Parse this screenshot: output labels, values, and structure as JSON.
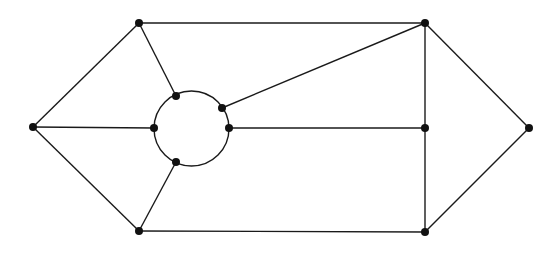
{
  "diagram": {
    "type": "graph",
    "colors": {
      "stroke": "#1a1a1a",
      "node": "#111111",
      "background": "#ffffff"
    },
    "circle": {
      "cx": 191.5,
      "cy": 128.5,
      "r": 37.5
    },
    "nodes": [
      {
        "id": "L",
        "x": 33,
        "y": 127
      },
      {
        "id": "TL",
        "x": 139,
        "y": 23
      },
      {
        "id": "BL",
        "x": 139,
        "y": 231
      },
      {
        "id": "TR",
        "x": 425,
        "y": 23
      },
      {
        "id": "MR",
        "x": 425,
        "y": 128
      },
      {
        "id": "BR",
        "x": 425,
        "y": 232
      },
      {
        "id": "R",
        "x": 529,
        "y": 128
      },
      {
        "id": "C1",
        "x": 176,
        "y": 96
      },
      {
        "id": "C2",
        "x": 222,
        "y": 108
      },
      {
        "id": "C3",
        "x": 229,
        "y": 128
      },
      {
        "id": "C4",
        "x": 154,
        "y": 128
      },
      {
        "id": "C5",
        "x": 176,
        "y": 162
      }
    ],
    "edges": [
      [
        "L",
        "TL"
      ],
      [
        "L",
        "BL"
      ],
      [
        "L",
        "C4"
      ],
      [
        "TL",
        "TR"
      ],
      [
        "TL",
        "C1"
      ],
      [
        "BL",
        "BR"
      ],
      [
        "BL",
        "C5"
      ],
      [
        "TR",
        "C2"
      ],
      [
        "TR",
        "MR"
      ],
      [
        "TR",
        "R"
      ],
      [
        "C3",
        "MR"
      ],
      [
        "MR",
        "BR"
      ],
      [
        "BR",
        "R"
      ]
    ]
  }
}
